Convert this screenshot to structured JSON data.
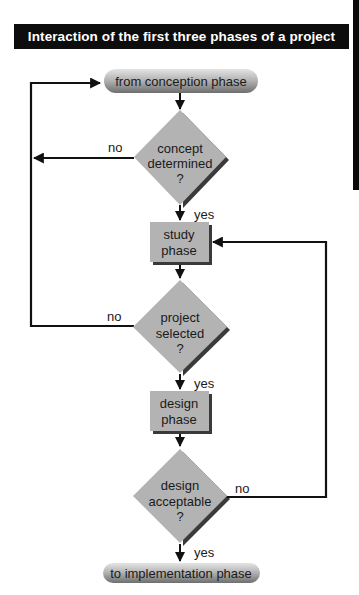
{
  "title": "Interaction of the first three phases of a project",
  "nodes": {
    "start": "from conception phase",
    "decision1": [
      "concept",
      "determined",
      "?"
    ],
    "study": [
      "study",
      "phase"
    ],
    "decision2": [
      "project",
      "selected",
      "?"
    ],
    "design": [
      "design",
      "phase"
    ],
    "decision3": [
      "design",
      "acceptable",
      "?"
    ],
    "end": "to implementation phase"
  },
  "edges": {
    "d1_no": "no",
    "d1_yes": "yes",
    "d2_no": "no",
    "d2_yes": "yes",
    "d3_no": "no",
    "d3_yes": "yes"
  },
  "colors": {
    "node_fill": "#b3b3b3",
    "shadow": "#3a3a3a",
    "line": "#111111",
    "title_bg": "#0d0d0d",
    "title_text": "#ffffff"
  }
}
